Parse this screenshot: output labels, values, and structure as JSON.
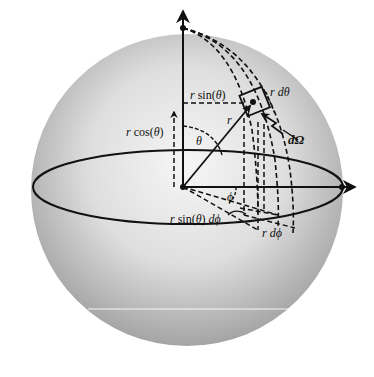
{
  "diagram": {
    "colors": {
      "background": "#ffffff",
      "sphere_highlight": "#f4f4f4",
      "sphere_shade": "#a8a8a8",
      "ink": "#111111",
      "artifact_line": "#f2f2f2"
    },
    "labels": {
      "r_sin_theta": "r sin(θ)",
      "r_cos_theta": "r cos(θ)",
      "r": "r",
      "theta": "θ",
      "phi": "ϕ",
      "r_dtheta": "r dθ",
      "d_omega": "dΩ",
      "r_sin_theta_dphi": "r sin(θ) dϕ",
      "r_dphi": "r dϕ"
    },
    "elements": [
      {
        "id": "sphere",
        "type": "shaded circle",
        "center": [
          187,
          187
        ],
        "radius": 155
      },
      {
        "id": "equator",
        "type": "ellipse",
        "center": [
          187,
          187
        ],
        "rx": 154,
        "ry": 37
      },
      {
        "id": "z-axis",
        "type": "arrow",
        "from": [
          183,
          187
        ],
        "to": [
          183,
          12
        ]
      },
      {
        "id": "x-axis",
        "type": "arrow",
        "from": [
          183,
          187
        ],
        "to": [
          355,
          187
        ]
      },
      {
        "id": "radius-vector",
        "type": "arrow",
        "from": [
          183,
          187
        ],
        "to": [
          252,
          102
        ]
      },
      {
        "id": "surface-element",
        "type": "rotated rectangle",
        "center": [
          253,
          100
        ]
      },
      {
        "id": "meridians",
        "type": "dashed curves",
        "count": 3
      },
      {
        "id": "projections",
        "type": "dashed lines"
      }
    ]
  }
}
